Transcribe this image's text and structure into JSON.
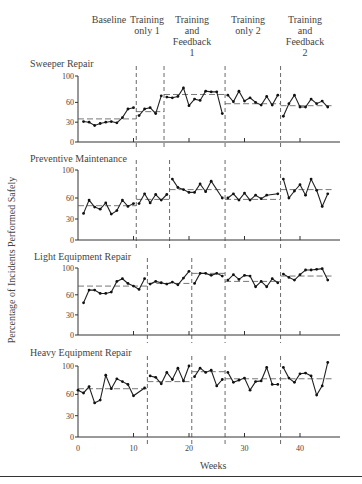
{
  "phases": [
    {
      "label": "Baseline"
    },
    {
      "label": "Training only 1"
    },
    {
      "label": "Training and Feedback 1"
    },
    {
      "label": "Training only 2"
    },
    {
      "label": "Training and Feedback 2"
    }
  ],
  "y_axis_label": "Percentage of Incidents Performed Safely",
  "x_axis_label": "Weeks",
  "chart_data": {
    "type": "line",
    "title": "",
    "xlabel": "Weeks",
    "ylabel": "Percentage of Incidents Performed Safely",
    "x_ticks": [
      0,
      10,
      20,
      30,
      40
    ],
    "y_ticks": [
      0,
      30,
      60,
      100
    ],
    "ylim": [
      0,
      100
    ],
    "xlim": [
      0,
      48
    ],
    "grid": false,
    "phase_labels": [
      "Baseline",
      "Training only 1",
      "Training and Feedback 1",
      "Training only 2",
      "Training and Feedback 2"
    ],
    "series": [
      {
        "name": "Sweeper Repair",
        "phase_changes": [
          10,
          15,
          26,
          36
        ],
        "phase_means": [
          35,
          46,
          72,
          58,
          55
        ],
        "points": [
          [
            1,
            31
          ],
          [
            2,
            30
          ],
          [
            3,
            25
          ],
          [
            4,
            28
          ],
          [
            5,
            30
          ],
          [
            6,
            31
          ],
          [
            7,
            29
          ],
          [
            8,
            37
          ],
          [
            9,
            50
          ],
          [
            10,
            52
          ],
          [
            11,
            40
          ],
          [
            12,
            50
          ],
          [
            13,
            52
          ],
          [
            14,
            43
          ],
          [
            15,
            70
          ],
          [
            16,
            68
          ],
          [
            17,
            67
          ],
          [
            18,
            69
          ],
          [
            19,
            82
          ],
          [
            20,
            55
          ],
          [
            21,
            65
          ],
          [
            22,
            63
          ],
          [
            23,
            77
          ],
          [
            24,
            76
          ],
          [
            25,
            76
          ],
          [
            26,
            43
          ],
          [
            27,
            71
          ],
          [
            28,
            61
          ],
          [
            29,
            77
          ],
          [
            30,
            62
          ],
          [
            31,
            67
          ],
          [
            32,
            60
          ],
          [
            33,
            56
          ],
          [
            34,
            69
          ],
          [
            35,
            56
          ],
          [
            36,
            71
          ],
          [
            37,
            39
          ],
          [
            38,
            58
          ],
          [
            39,
            71
          ],
          [
            40,
            53
          ],
          [
            41,
            53
          ],
          [
            42,
            65
          ],
          [
            43,
            58
          ],
          [
            44,
            62
          ],
          [
            45,
            53
          ]
        ]
      },
      {
        "name": "Preventive Maintenance",
        "phase_changes": [
          10,
          16,
          26,
          36
        ],
        "phase_means": [
          49,
          58,
          72,
          58,
          72
        ],
        "points": [
          [
            1,
            38
          ],
          [
            2,
            57
          ],
          [
            3,
            47
          ],
          [
            4,
            44
          ],
          [
            5,
            53
          ],
          [
            6,
            37
          ],
          [
            7,
            42
          ],
          [
            8,
            57
          ],
          [
            9,
            48
          ],
          [
            10,
            52
          ],
          [
            11,
            52
          ],
          [
            12,
            66
          ],
          [
            13,
            53
          ],
          [
            14,
            65
          ],
          [
            15,
            57
          ],
          [
            16,
            65
          ],
          [
            17,
            87
          ],
          [
            18,
            75
          ],
          [
            19,
            72
          ],
          [
            20,
            68
          ],
          [
            21,
            68
          ],
          [
            22,
            80
          ],
          [
            23,
            69
          ],
          [
            24,
            84
          ],
          [
            26,
            60
          ],
          [
            27,
            60
          ],
          [
            28,
            66
          ],
          [
            29,
            57
          ],
          [
            30,
            67
          ],
          [
            31,
            57
          ],
          [
            32,
            64
          ],
          [
            33,
            59
          ],
          [
            34,
            64
          ],
          [
            36,
            66
          ],
          [
            37,
            87
          ],
          [
            38,
            60
          ],
          [
            39,
            70
          ],
          [
            40,
            79
          ],
          [
            41,
            64
          ],
          [
            42,
            87
          ],
          [
            43,
            71
          ],
          [
            44,
            48
          ],
          [
            45,
            66
          ]
        ]
      },
      {
        "name": "Light Equipment Repair",
        "phase_changes": [
          12,
          20,
          26,
          36
        ],
        "phase_means": [
          73,
          77,
          92,
          80,
          88
        ],
        "points": [
          [
            1,
            48
          ],
          [
            2,
            67
          ],
          [
            3,
            67
          ],
          [
            4,
            62
          ],
          [
            5,
            62
          ],
          [
            6,
            64
          ],
          [
            7,
            80
          ],
          [
            8,
            84
          ],
          [
            9,
            77
          ],
          [
            10,
            73
          ],
          [
            11,
            68
          ],
          [
            12,
            84
          ],
          [
            13,
            76
          ],
          [
            14,
            80
          ],
          [
            15,
            78
          ],
          [
            16,
            76
          ],
          [
            17,
            79
          ],
          [
            18,
            75
          ],
          [
            19,
            85
          ],
          [
            20,
            95
          ],
          [
            21,
            77
          ],
          [
            22,
            92
          ],
          [
            23,
            92
          ],
          [
            24,
            89
          ],
          [
            25,
            92
          ],
          [
            26,
            88
          ],
          [
            27,
            82
          ],
          [
            28,
            90
          ],
          [
            29,
            83
          ],
          [
            30,
            89
          ],
          [
            31,
            88
          ],
          [
            32,
            72
          ],
          [
            33,
            80
          ],
          [
            34,
            72
          ],
          [
            35,
            84
          ],
          [
            36,
            78
          ],
          [
            37,
            91
          ],
          [
            38,
            86
          ],
          [
            39,
            82
          ],
          [
            40,
            90
          ],
          [
            41,
            97
          ],
          [
            42,
            97
          ],
          [
            43,
            98
          ],
          [
            44,
            99
          ],
          [
            45,
            82
          ]
        ]
      },
      {
        "name": "Heavy Equipment Repair",
        "phase_changes": [
          12,
          20,
          26,
          36
        ],
        "phase_means": [
          68,
          78,
          92,
          82,
          82
        ],
        "points": [
          [
            0,
            66
          ],
          [
            1,
            62
          ],
          [
            2,
            71
          ],
          [
            3,
            48
          ],
          [
            4,
            52
          ],
          [
            5,
            87
          ],
          [
            6,
            68
          ],
          [
            7,
            82
          ],
          [
            8,
            78
          ],
          [
            9,
            74
          ],
          [
            10,
            58
          ],
          [
            12,
            69
          ],
          [
            13,
            86
          ],
          [
            14,
            84
          ],
          [
            15,
            75
          ],
          [
            16,
            91
          ],
          [
            17,
            81
          ],
          [
            18,
            97
          ],
          [
            19,
            79
          ],
          [
            20,
            100
          ],
          [
            21,
            85
          ],
          [
            22,
            97
          ],
          [
            23,
            91
          ],
          [
            24,
            94
          ],
          [
            25,
            72
          ],
          [
            26,
            81
          ],
          [
            27,
            91
          ],
          [
            28,
            77
          ],
          [
            29,
            80
          ],
          [
            30,
            83
          ],
          [
            31,
            66
          ],
          [
            32,
            78
          ],
          [
            33,
            79
          ],
          [
            34,
            98
          ],
          [
            35,
            74
          ],
          [
            36,
            74
          ],
          [
            37,
            98
          ],
          [
            38,
            83
          ],
          [
            39,
            77
          ],
          [
            40,
            89
          ],
          [
            41,
            90
          ],
          [
            42,
            86
          ],
          [
            43,
            59
          ],
          [
            44,
            72
          ],
          [
            45,
            107
          ]
        ]
      }
    ]
  }
}
